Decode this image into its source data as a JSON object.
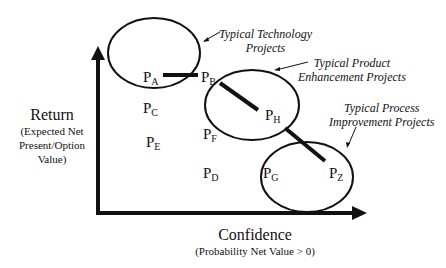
{
  "axes": {
    "y": {
      "title": "Return",
      "subtitle_lines": [
        "(Expected Net",
        "Present/Option",
        "Value)"
      ]
    },
    "x": {
      "title": "Confidence",
      "subtitle": "(Probability Net Value > 0)"
    }
  },
  "points": [
    {
      "id": "A",
      "letter": "P",
      "sub": "A"
    },
    {
      "id": "B",
      "letter": "P",
      "sub": "B"
    },
    {
      "id": "C",
      "letter": "P",
      "sub": "C"
    },
    {
      "id": "D",
      "letter": "P",
      "sub": "D"
    },
    {
      "id": "E",
      "letter": "P",
      "sub": "E"
    },
    {
      "id": "F",
      "letter": "P",
      "sub": "F"
    },
    {
      "id": "G",
      "letter": "P",
      "sub": "G"
    },
    {
      "id": "H",
      "letter": "P",
      "sub": "H"
    },
    {
      "id": "Z",
      "letter": "P",
      "sub": "Z"
    }
  ],
  "clusters": [
    {
      "name": "technology",
      "lines": [
        "Typical Technology",
        "Projects"
      ]
    },
    {
      "name": "product",
      "lines": [
        "Typical Product",
        "Enhancement Projects"
      ]
    },
    {
      "name": "process",
      "lines": [
        "Typical Process",
        "Improvement Projects"
      ]
    }
  ],
  "colors": {
    "ink": "#111111",
    "background": "#ffffff"
  }
}
